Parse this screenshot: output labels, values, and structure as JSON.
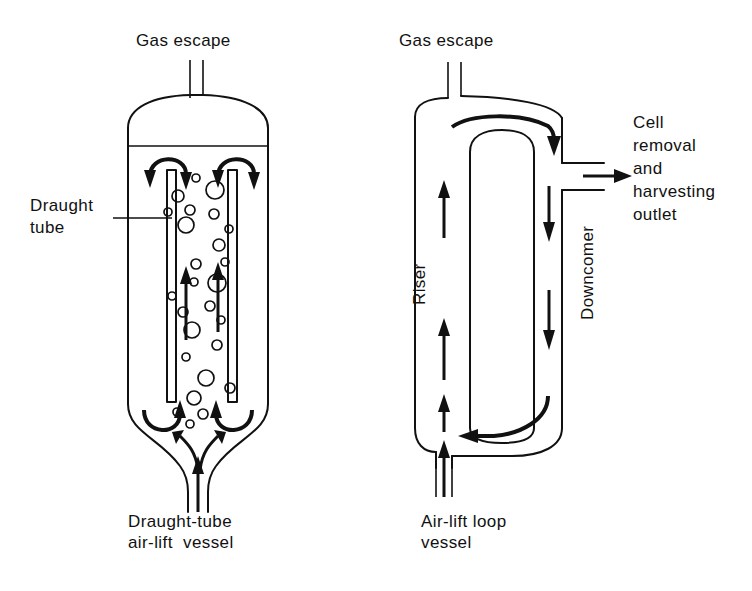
{
  "figure": {
    "background_color": "#ffffff",
    "line_color": "#111111"
  },
  "left_diagram": {
    "name": "draught-tube-air-lift-vessel",
    "caption_line1": "Draught-tube",
    "caption_line2": "air-lift  vessel",
    "gas_escape_label": "Gas escape",
    "draught_tube_label_line1": "Draught",
    "draught_tube_label_line2": "tube",
    "features": {
      "vessel_shape": "cylindrical with domed top and conical tapered bottom",
      "liquid_level": "horizontal line below dome",
      "internal_component": "concentric draught tube (two vertical walls)",
      "gas_inlet": "bottom centre sparger pipe",
      "gas_outlet": "top centre escape pipe",
      "bubble_count": 26,
      "circulation": "upward inside draught tube, downward in annulus"
    },
    "bubbles": [
      {
        "cx": 196,
        "cy": 178,
        "r": 4
      },
      {
        "cx": 178,
        "cy": 196,
        "r": 6
      },
      {
        "cx": 215,
        "cy": 190,
        "r": 9
      },
      {
        "cx": 190,
        "cy": 210,
        "r": 5
      },
      {
        "cx": 168,
        "cy": 212,
        "r": 4
      },
      {
        "cx": 214,
        "cy": 214,
        "r": 5
      },
      {
        "cx": 186,
        "cy": 225,
        "r": 8
      },
      {
        "cx": 229,
        "cy": 229,
        "r": 4
      },
      {
        "cx": 219,
        "cy": 245,
        "r": 6
      },
      {
        "cx": 196,
        "cy": 264,
        "r": 5
      },
      {
        "cx": 225,
        "cy": 262,
        "r": 4
      },
      {
        "cx": 194,
        "cy": 282,
        "r": 4
      },
      {
        "cx": 217,
        "cy": 283,
        "r": 9
      },
      {
        "cx": 172,
        "cy": 296,
        "r": 4
      },
      {
        "cx": 210,
        "cy": 306,
        "r": 5
      },
      {
        "cx": 183,
        "cy": 312,
        "r": 5
      },
      {
        "cx": 221,
        "cy": 320,
        "r": 4
      },
      {
        "cx": 192,
        "cy": 330,
        "r": 8
      },
      {
        "cx": 217,
        "cy": 345,
        "r": 5
      },
      {
        "cx": 186,
        "cy": 357,
        "r": 4
      },
      {
        "cx": 206,
        "cy": 378,
        "r": 8
      },
      {
        "cx": 194,
        "cy": 398,
        "r": 7
      },
      {
        "cx": 177,
        "cy": 412,
        "r": 4
      },
      {
        "cx": 203,
        "cy": 414,
        "r": 5
      },
      {
        "cx": 190,
        "cy": 424,
        "r": 4
      },
      {
        "cx": 230,
        "cy": 388,
        "r": 5
      }
    ]
  },
  "right_diagram": {
    "name": "air-lift-loop-vessel",
    "caption_line1": "Air-lift loop",
    "caption_line2": "vessel",
    "gas_escape_label": "Gas escape",
    "riser_label": "Riser",
    "downcomer_label": "Downcomer",
    "outlet_label_line1": "Cell",
    "outlet_label_line2": "removal",
    "outlet_label_line3": "and",
    "outlet_label_line4": "harvesting",
    "outlet_label_line5": "outlet",
    "features": {
      "vessel_shape": "cylindrical loop vessel with rounded top and bottom",
      "internal_component": "central baffle / inner draught tube open at both ends",
      "gas_inlet": "bottom sparger pipe on riser side",
      "gas_outlet": "top escape pipe on riser side",
      "outlet_port": "side port on downcomer side with outward arrow",
      "circulation": "up the riser, over the top, down the downcomer, back along the base"
    }
  }
}
